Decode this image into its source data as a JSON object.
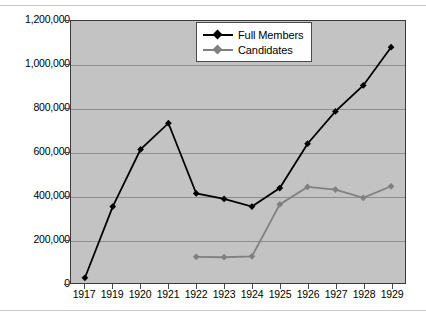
{
  "chart_data": {
    "type": "line",
    "title": "",
    "xlabel": "",
    "ylabel": "",
    "categories": [
      "1917",
      "1919",
      "1920",
      "1921",
      "1922",
      "1923",
      "1924",
      "1925",
      "1926",
      "1927",
      "1928",
      "1929"
    ],
    "ylim": [
      0,
      1200000
    ],
    "ytick_labels": [
      "0",
      "200,000",
      "400,000",
      "600,000",
      "800,000",
      "1,000,000",
      "1,200,000"
    ],
    "ytick_values": [
      0,
      200000,
      400000,
      600000,
      800000,
      1000000,
      1200000
    ],
    "grid": "horizontal",
    "legend_position": "top-center",
    "series": [
      {
        "name": "Full Members",
        "color": "#000000",
        "marker": "diamond",
        "values": [
          24000,
          350000,
          612000,
          732000,
          410000,
          385000,
          350000,
          435000,
          638000,
          786000,
          905000,
          1080000
        ]
      },
      {
        "name": "Candidates",
        "color": "#808080",
        "marker": "diamond",
        "values": [
          null,
          null,
          null,
          null,
          120000,
          118000,
          122000,
          360000,
          440000,
          428000,
          390000,
          443000
        ]
      }
    ]
  },
  "legend": {
    "items": [
      {
        "label": "Full Members"
      },
      {
        "label": "Candidates"
      }
    ]
  },
  "colors": {
    "plot_background": "#c3c3c3",
    "gridline": "#8e8e8e",
    "axis": "#3a3a3a",
    "series_full_members": "#000000",
    "series_candidates": "#808080",
    "page_background": "#ffffff"
  }
}
